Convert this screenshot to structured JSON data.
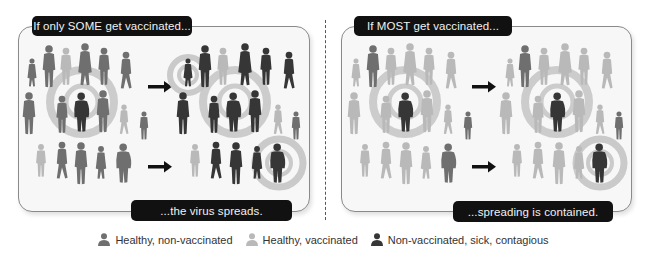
{
  "colors": {
    "sick": "#363636",
    "nonvaccinated": "#6f6f6f",
    "vaccinated": "#b9b9b9",
    "ring": "#c4c4c4",
    "label_bg": "#111111",
    "panel_bg": "#f7f7f7"
  },
  "panels": [
    {
      "id": "some",
      "top_label": "If only SOME get vaccinated...",
      "bottom_label": "...the virus spreads.",
      "outcome": "spreads"
    },
    {
      "id": "most",
      "top_label": "If MOST get vaccinated...",
      "bottom_label": "...spreading is contained.",
      "outcome": "contained"
    }
  ],
  "legend": [
    {
      "icon": "person-icon",
      "shade": "nonvaccinated",
      "label": "Healthy, non-vaccinated"
    },
    {
      "icon": "person-icon",
      "shade": "vaccinated",
      "label": "Healthy, vaccinated"
    },
    {
      "icon": "person-icon",
      "shade": "sick",
      "label": "Non-vaccinated, sick, contagious"
    }
  ],
  "arrows": [
    "arrow-right-icon",
    "arrow-right-icon"
  ]
}
